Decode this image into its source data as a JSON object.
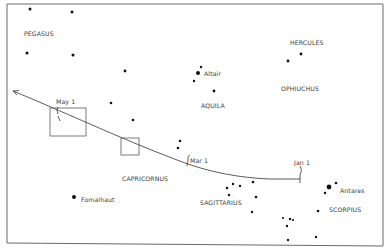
{
  "diagram": {
    "type": "star-chart",
    "frame": {
      "x1": 7,
      "y1": 4,
      "x2": 383,
      "y2": 245
    },
    "constellations": [
      {
        "name": "PEGASUS",
        "x": 24,
        "y": 36
      },
      {
        "name": "HERCULES",
        "x": 290,
        "y": 45
      },
      {
        "name": "OPHIUCHUS",
        "x": 281,
        "y": 91
      },
      {
        "name": "AQUILA",
        "x": 201,
        "y": 108
      },
      {
        "name": "CAPRICORNUS",
        "x": 122,
        "y": 181
      },
      {
        "name": "SAGITTARIUS",
        "x": 200,
        "y": 205
      },
      {
        "name": "SCORPIUS",
        "x": 329,
        "y": 212
      }
    ],
    "named_stars": [
      {
        "name": "Altair",
        "x": 204,
        "y": 76
      },
      {
        "name": "Fomalhaut",
        "x": 81,
        "y": 202
      },
      {
        "name": "Antares",
        "x": 340,
        "y": 193
      }
    ],
    "dates": [
      {
        "label": "May 1",
        "x": 56,
        "y": 104
      },
      {
        "label": "Mar 1",
        "x": 190,
        "y": 163
      },
      {
        "label": "Jan 1",
        "x": 294,
        "y": 165
      }
    ],
    "stars": [
      {
        "x": 30,
        "y": 9,
        "r": 1.5
      },
      {
        "x": 72,
        "y": 12,
        "r": 1.5
      },
      {
        "x": 27,
        "y": 53,
        "r": 1.5
      },
      {
        "x": 73,
        "y": 55,
        "r": 1.5
      },
      {
        "x": 125,
        "y": 71,
        "r": 1.4
      },
      {
        "x": 201,
        "y": 67,
        "r": 1.2
      },
      {
        "x": 198,
        "y": 73,
        "r": 2.0
      },
      {
        "x": 194,
        "y": 81,
        "r": 1.2
      },
      {
        "x": 214,
        "y": 91,
        "r": 1.4
      },
      {
        "x": 301,
        "y": 54,
        "r": 1.4
      },
      {
        "x": 288,
        "y": 61,
        "r": 1.4
      },
      {
        "x": 111,
        "y": 103,
        "r": 1.3
      },
      {
        "x": 133,
        "y": 120,
        "r": 1.3
      },
      {
        "x": 180,
        "y": 141,
        "r": 1.3
      },
      {
        "x": 178,
        "y": 148,
        "r": 1.3
      },
      {
        "x": 74,
        "y": 197,
        "r": 2.0
      },
      {
        "x": 227,
        "y": 188,
        "r": 1.3
      },
      {
        "x": 233,
        "y": 184,
        "r": 1.2
      },
      {
        "x": 240,
        "y": 186,
        "r": 1.2
      },
      {
        "x": 253,
        "y": 182,
        "r": 1.3
      },
      {
        "x": 229,
        "y": 195,
        "r": 1.2
      },
      {
        "x": 256,
        "y": 197,
        "r": 1.3
      },
      {
        "x": 252,
        "y": 212,
        "r": 1.2
      },
      {
        "x": 329,
        "y": 187,
        "r": 2.4
      },
      {
        "x": 336,
        "y": 183,
        "r": 1.3
      },
      {
        "x": 325,
        "y": 193,
        "r": 1.2
      },
      {
        "x": 318,
        "y": 211,
        "r": 1.3
      },
      {
        "x": 283,
        "y": 218,
        "r": 1.1
      },
      {
        "x": 290,
        "y": 219,
        "r": 1.2
      },
      {
        "x": 293,
        "y": 220,
        "r": 1.1
      },
      {
        "x": 287,
        "y": 226,
        "r": 1.2
      },
      {
        "x": 288,
        "y": 240,
        "r": 1.2
      },
      {
        "x": 316,
        "y": 237,
        "r": 1.2
      }
    ],
    "boxes": [
      {
        "x": 50,
        "y": 108,
        "w": 36,
        "h": 28
      },
      {
        "x": 121,
        "y": 138,
        "w": 18,
        "h": 17
      }
    ]
  }
}
